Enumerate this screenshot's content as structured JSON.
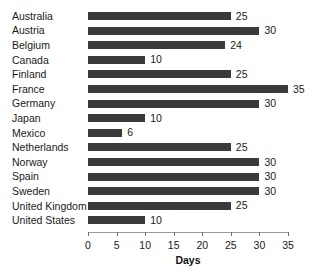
{
  "chart_data": {
    "type": "bar",
    "orientation": "horizontal",
    "title": "",
    "subtitle": "",
    "xlabel": "Days",
    "ylabel": "",
    "xlim": [
      0,
      35
    ],
    "xticks": [
      0,
      5,
      10,
      15,
      20,
      25,
      30,
      35
    ],
    "xtick_labels": [
      "0",
      "5",
      "10",
      "15",
      "20",
      "25",
      "30",
      "35"
    ],
    "grid": false,
    "legend": null,
    "bar_color": "#3a3a3a",
    "background_color": "#ffffff",
    "value_labels_shown": true,
    "categories": [
      "Australia",
      "Austria",
      "Belgium",
      "Canada",
      "Finland",
      "France",
      "Germany",
      "Japan",
      "Mexico",
      "Netherlands",
      "Norway",
      "Spain",
      "Sweden",
      "United Kingdom",
      "United States"
    ],
    "values": [
      25,
      30,
      24,
      10,
      25,
      35,
      30,
      10,
      6,
      25,
      30,
      30,
      30,
      25,
      10
    ],
    "value_label_texts": [
      "25",
      "30",
      "24",
      "10",
      "25",
      "35",
      "30",
      "10",
      "6",
      "25",
      "30",
      "30",
      "30",
      "25",
      "10"
    ]
  }
}
